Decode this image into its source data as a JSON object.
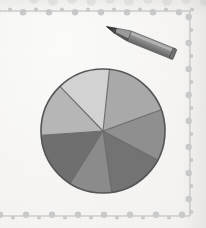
{
  "page": {
    "background_color": "#f8f7f5"
  },
  "border": {
    "name": "beaded-dotted-frame",
    "color": "#c9c9c9",
    "line_color": "#b9b9b9",
    "sides_visible": [
      "top",
      "right",
      "bottom"
    ],
    "bead_radius": 3.2,
    "bead_spacing": 13
  },
  "pencil": {
    "name": "pencil",
    "tip_color": "#2e2e2e",
    "body_color": "#8a8a8a",
    "body_highlight": "#a8a8a8",
    "body_shadow": "#666666",
    "angle_degrees": -22,
    "label": "Pencil"
  },
  "chart_data": {
    "type": "pie",
    "xlabel": "",
    "ylabel": "",
    "legend_position": "none",
    "grid": false,
    "center": [
      67,
      67
    ],
    "radius": 62,
    "outline_color": "#555555",
    "divider_color": "#6a6a6a",
    "start_angle_degrees": -84,
    "labels": [
      "Segment 1",
      "Segment 2",
      "Segment 3",
      "Segment 4",
      "Segment 5",
      "Segment 6",
      "Segment 7"
    ],
    "values": [
      64,
      48,
      54,
      40,
      54,
      50,
      50
    ],
    "percentages": [
      17.8,
      13.3,
      15.0,
      11.1,
      15.0,
      13.9,
      13.9
    ],
    "colors": [
      "#a9a9a9",
      "#8f8f8f",
      "#737373",
      "#8b8b8b",
      "#6f6f6f",
      "#b6b6b6",
      "#d2d2d2"
    ]
  }
}
